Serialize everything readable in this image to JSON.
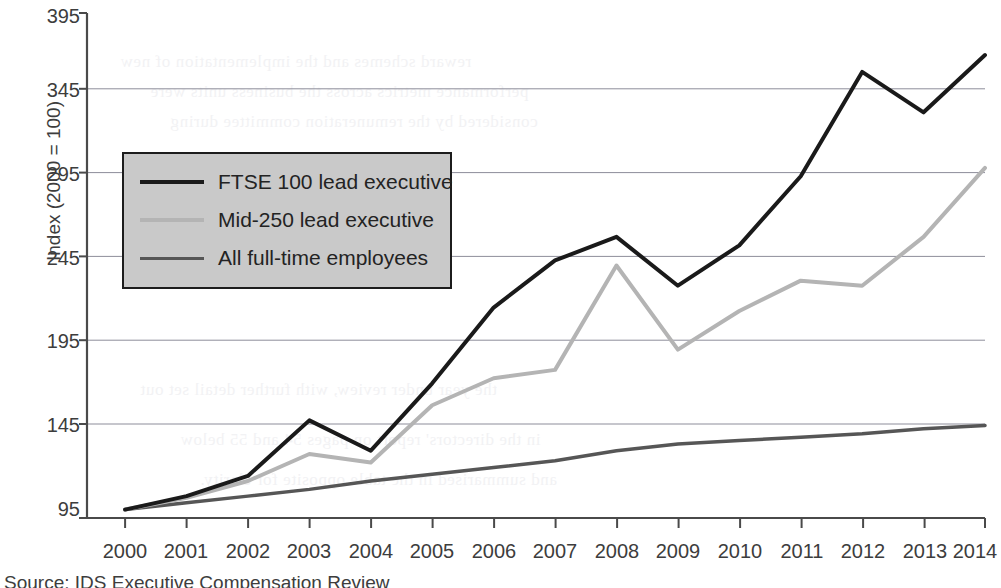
{
  "chart_data": {
    "type": "line",
    "title": "",
    "xlabel": "",
    "ylabel": "Index (2000 = 100)",
    "categories": [
      "2000",
      "2001",
      "2002",
      "2003",
      "2004",
      "2005",
      "2006",
      "2007",
      "2008",
      "2009",
      "2010",
      "2011",
      "2012",
      "2013",
      "2014"
    ],
    "x": [
      2000,
      2001,
      2002,
      2003,
      2004,
      2005,
      2006,
      2007,
      2008,
      2009,
      2010,
      2011,
      2012,
      2013,
      2014
    ],
    "ylim": [
      95,
      395
    ],
    "xlim": [
      2000,
      2014
    ],
    "yticks": [
      95,
      145,
      195,
      245,
      295,
      345,
      395
    ],
    "ytick_labels": [
      "95",
      "145",
      "195",
      "245",
      "295",
      "345",
      "395"
    ],
    "grid": true,
    "grid_axis": "y",
    "legend_position": "upper left inside",
    "series": [
      {
        "name": "FTSE 100 lead executive",
        "color": "#1a1a1a",
        "width": 4,
        "values": [
          100,
          108,
          120,
          153,
          135,
          175,
          220,
          248,
          262,
          233,
          257,
          298,
          360,
          336,
          370
        ]
      },
      {
        "name": "Mid-250 lead executive",
        "color": "#b4b4b4",
        "width": 4,
        "values": [
          100,
          107,
          117,
          133,
          128,
          162,
          178,
          183,
          245,
          195,
          218,
          236,
          233,
          262,
          303
        ]
      },
      {
        "name": "All full-time employees",
        "color": "#565656",
        "width": 3.5,
        "values": [
          100,
          104,
          108,
          112,
          117,
          121,
          125,
          129,
          135,
          139,
          141,
          143,
          145,
          148,
          150
        ]
      }
    ]
  },
  "axis": {
    "y_title": "Index (2000 = 100)",
    "y_tick_labels": [
      "395",
      "345",
      "295",
      "245",
      "195",
      "145",
      "95"
    ],
    "x_tick_labels": [
      "2000",
      "2001",
      "2002",
      "2003",
      "2004",
      "2005",
      "2006",
      "2007",
      "2008",
      "2009",
      "2010",
      "2011",
      "2012",
      "2013",
      "2014"
    ]
  },
  "legend": {
    "entries": [
      {
        "label": "FTSE 100 lead executive",
        "color": "#1a1a1a"
      },
      {
        "label": "Mid-250 lead executive",
        "color": "#b4b4b4"
      },
      {
        "label": "All full-time employees",
        "color": "#565656"
      }
    ]
  },
  "footer": {
    "source": "Source: IDS Executive Compensation Review"
  },
  "colors": {
    "axis": "#4a4a4a",
    "grid": "#8d8d9a",
    "text": "#3d3d3d",
    "legend_background": "#c9c9c9",
    "legend_border": "#1c1c1c"
  },
  "bleed_text": {
    "lines": [
      "reward schemes and the implementation of new",
      "performance metrics across the business units were",
      "considered by the remuneration committee during",
      "the year under review, with further detail set out",
      "in the directors' report on pages 54 and 55 below",
      "and summarised in the table opposite for clarity."
    ]
  }
}
